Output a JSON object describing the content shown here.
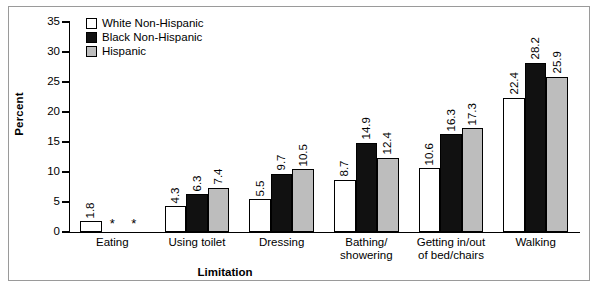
{
  "chart_data": {
    "type": "bar",
    "title": "",
    "xlabel": "Limitation",
    "ylabel": "Percent",
    "ylim": [
      0,
      35
    ],
    "yticks": [
      0,
      5,
      10,
      15,
      20,
      25,
      30,
      35
    ],
    "grid": false,
    "legend_position": "top-left",
    "categories": [
      "Eating",
      "Using toilet",
      "Dressing",
      "Bathing/ showering",
      "Getting in/out of bed/chairs",
      "Walking"
    ],
    "series": [
      {
        "name": "White Non-Hispanic",
        "color": "#ffffff",
        "values": [
          1.8,
          4.3,
          5.5,
          8.7,
          10.6,
          22.4
        ],
        "labels": [
          "1.8",
          "4.3",
          "5.5",
          "8.7",
          "10.6",
          "22.4"
        ]
      },
      {
        "name": "Black Non-Hispanic",
        "color": "#111111",
        "values": [
          null,
          6.3,
          9.7,
          14.9,
          16.3,
          28.2
        ],
        "labels": [
          "*",
          "6.3",
          "9.7",
          "14.9",
          "16.3",
          "28.2"
        ]
      },
      {
        "name": "Hispanic",
        "color": "#bdbdbd",
        "values": [
          null,
          7.4,
          10.5,
          12.4,
          17.3,
          25.9
        ],
        "labels": [
          "*",
          "7.4",
          "10.5",
          "12.4",
          "17.3",
          "25.9"
        ]
      }
    ],
    "suppressed_marker": "*"
  },
  "axis": {
    "y_title": "Percent",
    "x_title": "Limitation",
    "tick_labels": [
      "35",
      "30",
      "25",
      "20",
      "15",
      "10",
      "5",
      "0"
    ]
  },
  "legend": {
    "items": [
      {
        "label": "White Non-Hispanic",
        "color": "#ffffff"
      },
      {
        "label": "Black Non-Hispanic",
        "color": "#111111"
      },
      {
        "label": "Hispanic",
        "color": "#bdbdbd"
      }
    ]
  },
  "group_labels": [
    {
      "line1": "Eating",
      "line2": ""
    },
    {
      "line1": "Using toilet",
      "line2": ""
    },
    {
      "line1": "Dressing",
      "line2": ""
    },
    {
      "line1": "Bathing/",
      "line2": "showering"
    },
    {
      "line1": "Getting in/out",
      "line2": "of bed/chairs"
    },
    {
      "line1": "Walking",
      "line2": ""
    }
  ]
}
